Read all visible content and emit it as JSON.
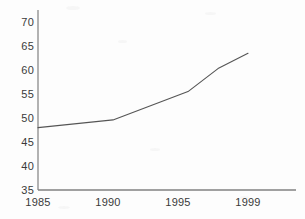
{
  "chart_data": {
    "type": "line",
    "title": "",
    "subtitle": "",
    "xlabel": "",
    "ylabel": "",
    "x": [
      1985,
      1990,
      1995,
      1997,
      1999
    ],
    "values": [
      48.0,
      49.6,
      55.5,
      60.3,
      63.5
    ],
    "series": [
      {
        "name": "",
        "values": [
          48.0,
          49.6,
          55.5,
          60.3,
          63.5
        ]
      }
    ],
    "xlim": [
      1985,
      2000.5
    ],
    "ylim": [
      35,
      72
    ],
    "ytick_labels": [
      "70",
      "65",
      "60",
      "55",
      "50",
      "45",
      "40",
      "35"
    ],
    "ytick_values": [
      70,
      65,
      60,
      55,
      50,
      45,
      40,
      35
    ],
    "xtick_labels": [
      "1985",
      "1990",
      "1995",
      "1999"
    ],
    "xtick_values": [
      1985,
      1990,
      1995,
      1999
    ],
    "grid": false,
    "legend": false,
    "legend_position": "none",
    "line_color": "#555555",
    "axis_color": "#808080",
    "background_color": "#fdfdfd",
    "text_color": "#3a3a3a"
  },
  "axes": {
    "y_axis_name": "value-axis",
    "x_axis_name": "year-axis"
  }
}
